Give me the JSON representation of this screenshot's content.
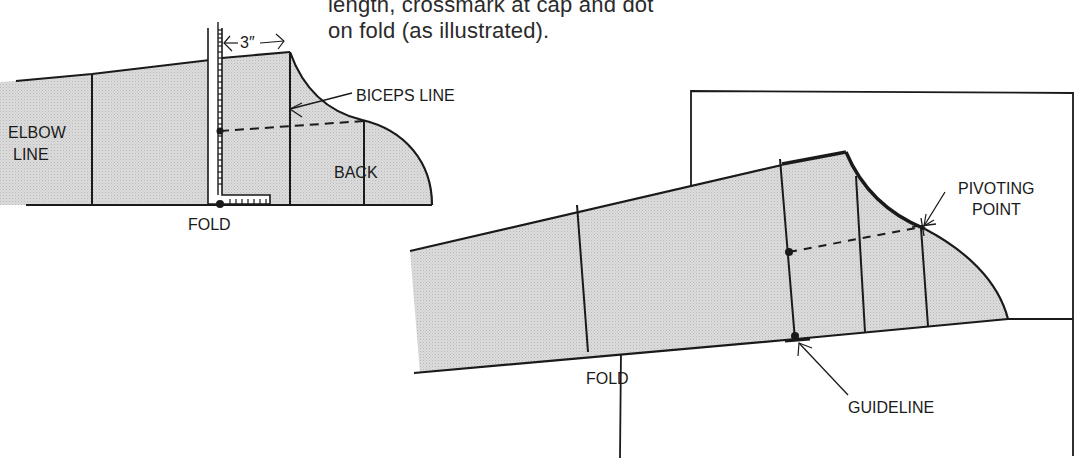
{
  "caption": {
    "line1": "length, crossmark at cap and dot",
    "line2": "on fold (as illustrated)."
  },
  "left_diagram": {
    "measure_label": "3″",
    "labels": {
      "biceps_line": "BICEPS LINE",
      "elbow_line_1": "ELBOW",
      "elbow_line_2": "LINE",
      "back": "BACK",
      "fold": "FOLD"
    }
  },
  "right_diagram": {
    "labels": {
      "pivoting_point_1": "PIVOTING",
      "pivoting_point_2": "POINT",
      "fold": "FOLD",
      "guideline": "GUIDELINE"
    }
  },
  "colors": {
    "line": "#1a1a1a",
    "fill": "#d4d4d4",
    "background": "#ffffff"
  }
}
